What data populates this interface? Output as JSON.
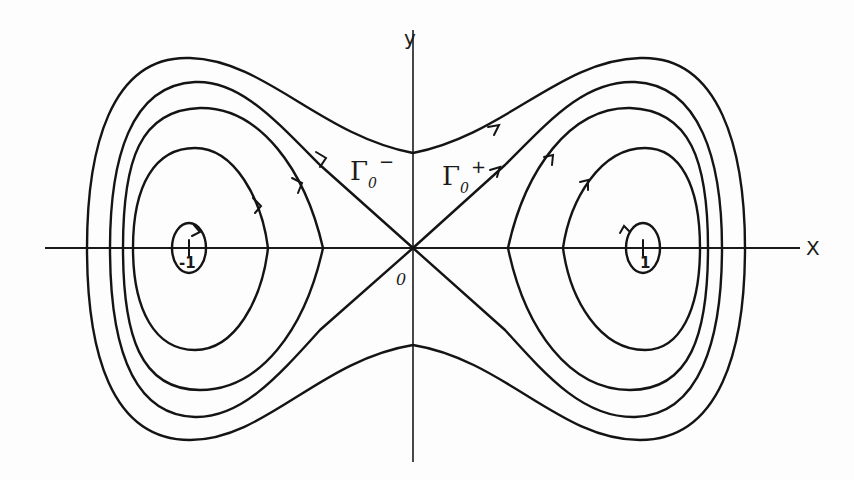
{
  "diagram": {
    "title": "",
    "type": "phase-portrait",
    "axes": {
      "x_label": "X",
      "y_label": "y",
      "origin_label": "0"
    },
    "equilibria": [
      {
        "label": "-1",
        "kind": "center",
        "x": -1
      },
      {
        "label": "0",
        "kind": "saddle",
        "x": 0
      },
      {
        "label": "1",
        "kind": "center",
        "x": 1
      }
    ],
    "separatrix_labels": {
      "left": {
        "symbol": "Γ",
        "sub": "0",
        "sup": "−"
      },
      "right": {
        "symbol": "Γ",
        "sub": "0",
        "sup": "+"
      }
    },
    "colors": {
      "ink": "#141414",
      "paper": "#fdfdfd"
    }
  }
}
